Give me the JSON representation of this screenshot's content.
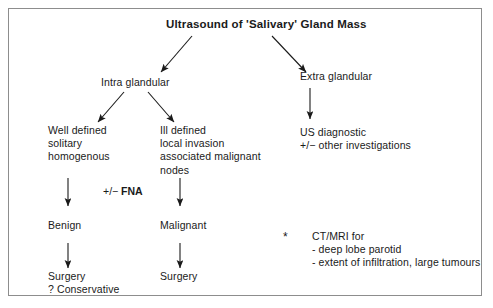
{
  "diagram": {
    "title": "Ultrasound of 'Salivary' Gland Mass",
    "branches": {
      "intra_glandular": "Intra glandular",
      "extra_glandular": "Extra glandular"
    },
    "intra_left": {
      "line1": "Well defined",
      "line2": "solitary",
      "line3": "homogenous",
      "full": "Well defined\nsolitary\nhomogenous"
    },
    "intra_right": {
      "line1": "Ill defined",
      "line2": "local invasion",
      "line3": "associated malignant",
      "line4": "nodes",
      "full": "Ill defined\nlocal invasion\nassociated malignant\nnodes"
    },
    "extra_result": {
      "line1": "US diagnostic",
      "line2": "+/− other investigations",
      "full": "US diagnostic\n+/− other investigations"
    },
    "fna_label_prefix": "+/− ",
    "fna_label_bold": "FNA",
    "outcomes": {
      "benign": "Benign",
      "malignant": "Malignant"
    },
    "treatments": {
      "benign_line1": "Surgery",
      "benign_line2": "? Conservative",
      "benign_full": "Surgery\n? Conservative",
      "malignant": "Surgery"
    },
    "footnote": {
      "marker": "*",
      "line1": "CT/MRI for",
      "line2": "- deep lobe parotid",
      "line3": "- extent of infiltration, large tumours",
      "full": "CT/MRI for\n- deep lobe parotid\n- extent of infiltration, large tumours"
    },
    "colors": {
      "text": "#1a1a1a",
      "border": "#8d8d8d",
      "arrow": "#1a1a1a",
      "background": "#ffffff"
    }
  }
}
